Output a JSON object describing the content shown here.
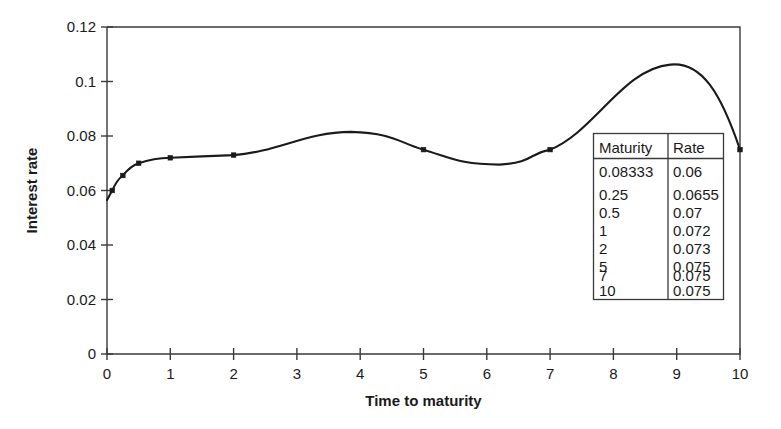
{
  "chart_data": {
    "type": "line",
    "title": "",
    "xlabel": "Time to maturity",
    "ylabel": "Interest rate",
    "xlim": [
      0,
      10
    ],
    "ylim": [
      0,
      0.12
    ],
    "grid": false,
    "legend": "none",
    "interpolation": "cubic-spline-with-overshoot",
    "marker": "filled-square",
    "x": [
      0.08333,
      0.25,
      0.5,
      1,
      2,
      5,
      7,
      10
    ],
    "values": [
      0.06,
      0.0655,
      0.07,
      0.072,
      0.073,
      0.075,
      0.075,
      0.075
    ],
    "series": [
      {
        "name": "Zero curve",
        "x": [
          0.08333,
          0.25,
          0.5,
          1,
          2,
          5,
          7,
          10
        ],
        "values": [
          0.06,
          0.0655,
          0.07,
          0.072,
          0.073,
          0.075,
          0.075,
          0.075
        ]
      }
    ],
    "xticks": [
      0,
      1,
      2,
      3,
      4,
      5,
      6,
      7,
      8,
      9,
      10
    ],
    "xtick_labels": [
      "0",
      "1",
      "2",
      "3",
      "4",
      "5",
      "6",
      "7",
      "8",
      "9",
      "10"
    ],
    "yticks": [
      0,
      0.02,
      0.04,
      0.06,
      0.08,
      0.1,
      0.12
    ],
    "ytick_labels": [
      "0",
      "0.02",
      "0.04",
      "0.06",
      "0.08",
      "0.1",
      "0.12"
    ],
    "annotations": [
      {
        "note": "spline overshoot bulge",
        "x": 3.7,
        "y": 0.0815
      },
      {
        "note": "spline dip",
        "x": 6.05,
        "y": 0.0695
      },
      {
        "note": "spline overshoot peak",
        "x": 8.9,
        "y": 0.1062
      }
    ],
    "curve_color": "#1a1a1a",
    "axis_color": "#3a3a3a"
  },
  "data_table": {
    "headers": [
      "Maturity",
      "Rate"
    ],
    "rows": [
      [
        "0.08333",
        "0.06"
      ],
      [
        "0.25",
        "0.0655"
      ],
      [
        "0.5",
        "0.07"
      ],
      [
        "1",
        "0.072"
      ],
      [
        "2",
        "0.073"
      ],
      [
        "5",
        "0.075"
      ],
      [
        "7",
        "0.075"
      ],
      [
        "10",
        "0.075"
      ]
    ]
  }
}
